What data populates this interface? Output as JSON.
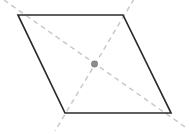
{
  "figure": {
    "background_color": "#ffffff",
    "width": 189,
    "height": 134
  },
  "colors": {
    "edge_stroke": "#2b2b2f",
    "diagonal_stroke": "#c9c9cc",
    "center_dot_fill": "#8c8c90",
    "center_dot_stroke": "#6e6e72",
    "interior_fill": "#ffffff"
  },
  "chart_data": {
    "type": "diagram",
    "shape": "parallelogram",
    "vertices": [
      {
        "name": "top-left",
        "x": 18,
        "y": 15
      },
      {
        "name": "top-right",
        "x": 123,
        "y": 15
      },
      {
        "name": "bottom-right",
        "x": 171,
        "y": 113
      },
      {
        "name": "bottom-left",
        "x": 65,
        "y": 113
      }
    ],
    "edges": [
      {
        "name": "top-edge",
        "from": "top-left",
        "to": "top-right",
        "style": "solid"
      },
      {
        "name": "right-edge",
        "from": "top-right",
        "to": "bottom-right",
        "style": "solid"
      },
      {
        "name": "bottom-edge",
        "from": "bottom-right",
        "to": "bottom-left",
        "style": "solid"
      },
      {
        "name": "left-edge",
        "from": "bottom-left",
        "to": "top-left",
        "style": "solid"
      }
    ],
    "diagonals": [
      {
        "name": "diagonal-tl-br",
        "style": "dashed",
        "from": "top-left",
        "to": "bottom-right",
        "extended": true,
        "path": "M 4 0 L 188 129"
      },
      {
        "name": "diagonal-tr-bl",
        "style": "dashed",
        "from": "top-right",
        "to": "bottom-left",
        "extended": true,
        "path": "M 134 -1 L 55 131"
      }
    ],
    "center_point": {
      "name": "diagonal-intersection",
      "x": 94.5,
      "y": 64,
      "radius": 3.2
    },
    "outline_path": "M 18 15 L 123 15 L 171 113 L 65 113 Z",
    "grid": false,
    "legend": null,
    "labels": []
  }
}
